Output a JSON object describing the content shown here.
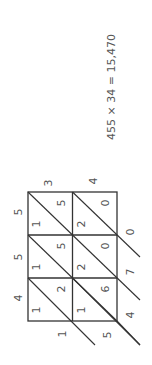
{
  "equation": {
    "text": "455 × 34 = 15,470"
  },
  "multiplicand_digits": [
    "4",
    "5",
    "5"
  ],
  "multiplier_digits": [
    "3",
    "4"
  ],
  "cells": [
    {
      "row": 0,
      "col": 0,
      "tens": "1",
      "ones": "5"
    },
    {
      "row": 0,
      "col": 1,
      "tens": "2",
      "ones": "0"
    },
    {
      "row": 1,
      "col": 0,
      "tens": "1",
      "ones": "5"
    },
    {
      "row": 1,
      "col": 1,
      "tens": "2",
      "ones": "0"
    },
    {
      "row": 2,
      "col": 0,
      "tens": "1",
      "ones": "2"
    },
    {
      "row": 2,
      "col": 1,
      "tens": "1",
      "ones": "6"
    }
  ],
  "result_digits": {
    "d0": "1",
    "d1": "5",
    "d2": "4",
    "d3": "7",
    "d4": "0"
  },
  "colors": {
    "line": "#333333",
    "text": "#555555",
    "background": "#ffffff"
  }
}
